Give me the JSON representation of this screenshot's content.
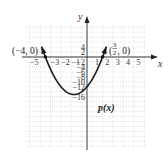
{
  "chart_data": {
    "type": "line",
    "title": "",
    "function_label": "p(x)",
    "equation": "p(x) = 2x^2 + 5x - 12",
    "xlabel": "x",
    "ylabel": "y",
    "xlim": [
      -5.8,
      5.8
    ],
    "ylim": [
      -19,
      7
    ],
    "grid": true,
    "x_ticks": [
      -5,
      -3,
      -2,
      -1,
      1,
      2,
      3,
      4,
      5
    ],
    "y_ticks": [
      4,
      2,
      -2,
      -4,
      -6,
      -8,
      -10,
      -12,
      -16
    ],
    "annotations": [
      {
        "label": "(−4, 0)",
        "x": -4,
        "y": 0
      },
      {
        "label": "(3/2, 0)",
        "x": 1.5,
        "y": 0
      }
    ],
    "x_intercepts": [
      -4,
      1.5
    ],
    "y_intercept": -12,
    "vertex": {
      "x": -1.25,
      "y": -15.125
    },
    "points": [
      {
        "x": -4.35,
        "y": 6.1
      },
      {
        "x": -4,
        "y": 0
      },
      {
        "x": -3,
        "y": -9
      },
      {
        "x": -2,
        "y": -14
      },
      {
        "x": -1.25,
        "y": -15.125
      },
      {
        "x": -1,
        "y": -15
      },
      {
        "x": 0,
        "y": -12
      },
      {
        "x": 1,
        "y": -5
      },
      {
        "x": 1.5,
        "y": 0
      },
      {
        "x": 1.85,
        "y": 6.1
      }
    ]
  },
  "labels": {
    "x_axis": "x",
    "y_axis": "y",
    "root_left": "(−4, 0)",
    "root_right_num": "3",
    "root_right_den": "2",
    "root_right_rest": ", 0)",
    "root_right_open": "(",
    "function": "p(x)"
  }
}
